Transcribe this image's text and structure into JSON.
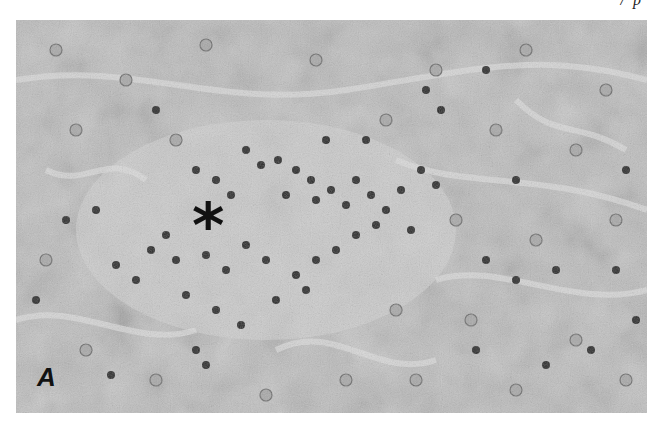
{
  "figure": {
    "header_fragment": "/ p",
    "panel_label": "A",
    "marker_symbol": "*",
    "image_description": "Grayscale histology micrograph of liver tissue showing hepatocyte plates and a central focus of dense inflammatory cell infiltrate marked by an asterisk",
    "colors": {
      "background": "#b9b9b9",
      "cytoplasm": "#c6c6c6",
      "sinusoid": "#d8d8d8",
      "nucleus_dark": "#2a2a2a",
      "nucleus_light": "#8a8a8a",
      "label": "#111111"
    }
  }
}
